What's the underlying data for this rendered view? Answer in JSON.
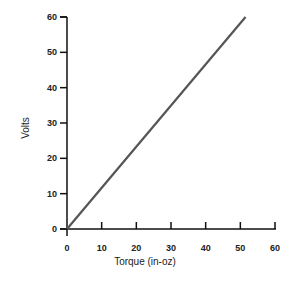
{
  "chart_data": {
    "type": "line",
    "title": "",
    "xlabel": "Torque (in-oz)",
    "ylabel": "Volts",
    "xlim": [
      0,
      60
    ],
    "ylim": [
      0,
      60
    ],
    "x_ticks": [
      "0",
      "10",
      "20",
      "30",
      "40",
      "50",
      "60"
    ],
    "y_ticks": [
      "0",
      "10",
      "20",
      "30",
      "40",
      "50",
      "60"
    ],
    "grid": false,
    "legend": null,
    "series": [
      {
        "name": "Volts vs Torque",
        "x": [
          0,
          51.5
        ],
        "y": [
          0,
          60
        ],
        "color": "#555555"
      }
    ]
  },
  "colors": {
    "axis": "#111111",
    "line": "#555555",
    "background": "#ffffff"
  }
}
